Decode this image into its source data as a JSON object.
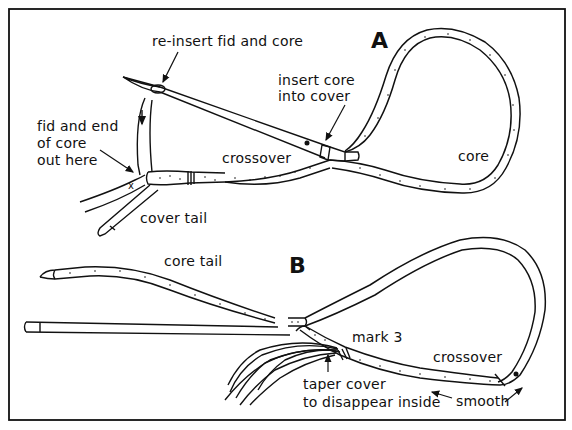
{
  "figure": {
    "panel_a": {
      "letter": "A",
      "labels": {
        "reinsert": "re-insert fid and core",
        "insert_core": "insert core\ninto cover",
        "fid_end": "fid and end\nof core\nout here",
        "crossover": "crossover",
        "core": "core",
        "cover_tail": "cover tail"
      }
    },
    "panel_b": {
      "letter": "B",
      "labels": {
        "core_tail": "core tail",
        "mark3": "mark 3",
        "crossover": "crossover",
        "taper": "taper cover\nto disappear inside",
        "smooth": "smooth"
      }
    },
    "colors": {
      "ink": "#111111",
      "paper": "#ffffff"
    }
  }
}
